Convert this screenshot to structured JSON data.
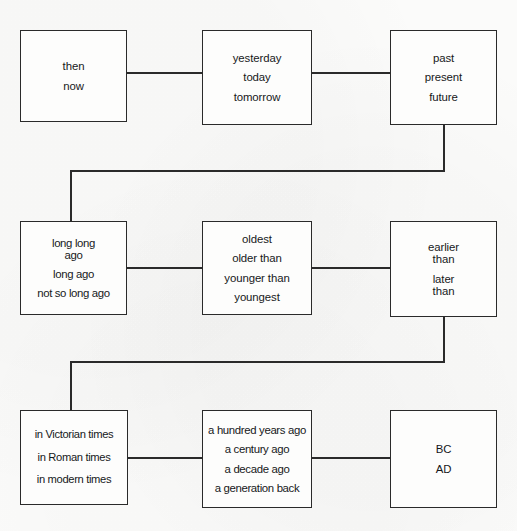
{
  "diagram": {
    "type": "flow-chart",
    "rows": 3,
    "columns": 3,
    "node_count": 9,
    "connector_count": 10,
    "colors": {
      "background": "#fbfbfa",
      "box_fill": "#fdfdfc",
      "stroke": "#2a2a2a",
      "text": "#16181a"
    }
  },
  "nodes": [
    {
      "id": "node-1",
      "name": "then-now",
      "row": 1,
      "column": 1,
      "lines": [
        "then",
        "now"
      ]
    },
    {
      "id": "node-2",
      "name": "yesterday-today-tomorrow",
      "row": 1,
      "column": 2,
      "lines": [
        "yesterday",
        "today",
        "tomorrow"
      ]
    },
    {
      "id": "node-3",
      "name": "past-present-future",
      "row": 1,
      "column": 3,
      "lines": [
        "past",
        "present",
        "future"
      ]
    },
    {
      "id": "node-4",
      "name": "long-long-ago",
      "row": 2,
      "column": 1,
      "lines": [
        "long long",
        "ago",
        "long ago",
        "not so long ago"
      ]
    },
    {
      "id": "node-5",
      "name": "oldest-youngest",
      "row": 2,
      "column": 2,
      "lines": [
        "oldest",
        "older than",
        "younger than",
        "youngest"
      ]
    },
    {
      "id": "node-6",
      "name": "earlier-later-than",
      "row": 2,
      "column": 3,
      "lines": [
        "earlier",
        "than",
        "later",
        "than"
      ]
    },
    {
      "id": "node-7",
      "name": "historical-times",
      "row": 3,
      "column": 1,
      "lines": [
        "in Victorian times",
        "in Roman times",
        "in modern times"
      ]
    },
    {
      "id": "node-8",
      "name": "relative-time-spans",
      "row": 3,
      "column": 2,
      "lines": [
        "a hundred years ago",
        "a century ago",
        "a decade ago",
        "a generation back"
      ]
    },
    {
      "id": "node-9",
      "name": "bc-ad",
      "row": 3,
      "column": 3,
      "lines": [
        "BC",
        "AD"
      ]
    }
  ],
  "connectors": [
    {
      "name": "connector-node1-node2",
      "from": "node-1",
      "to": "node-2",
      "kind": "horizontal"
    },
    {
      "name": "connector-node2-node3",
      "from": "node-2",
      "to": "node-3",
      "kind": "horizontal"
    },
    {
      "name": "connector-node3-node4",
      "from": "node-3",
      "to": "node-4",
      "kind": "elbow"
    },
    {
      "name": "connector-node4-node5",
      "from": "node-4",
      "to": "node-5",
      "kind": "horizontal"
    },
    {
      "name": "connector-node5-node6",
      "from": "node-5",
      "to": "node-6",
      "kind": "horizontal"
    },
    {
      "name": "connector-node6-node7",
      "from": "node-6",
      "to": "node-7",
      "kind": "elbow"
    },
    {
      "name": "connector-node7-node8",
      "from": "node-7",
      "to": "node-8",
      "kind": "horizontal"
    },
    {
      "name": "connector-node8-node9",
      "from": "node-8",
      "to": "node-9",
      "kind": "horizontal"
    }
  ]
}
